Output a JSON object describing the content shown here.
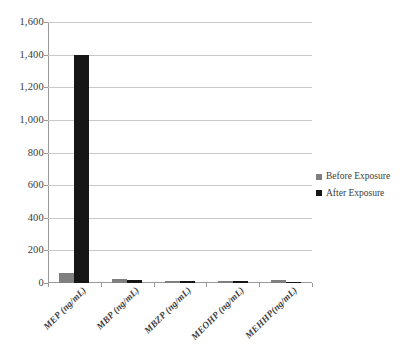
{
  "chart_data": {
    "type": "bar",
    "title": "",
    "xlabel": "",
    "ylabel": "",
    "ylim": [
      0,
      1600
    ],
    "ytick_step": 200,
    "grid": true,
    "legend_position": "right",
    "categories": [
      "MEP (ng/mL)",
      "MBP (ng/mL)",
      "MBZP (ng/mL)",
      "MEOHP (ng/mL)",
      "MEHHP(ng/mL)"
    ],
    "ytick_labels": [
      "0",
      "200",
      "400",
      "600",
      "800",
      "1,000",
      "1,200",
      "1,400",
      "1,600"
    ],
    "ytick_values": [
      0,
      200,
      400,
      600,
      800,
      1000,
      1200,
      1400,
      1600
    ],
    "series": [
      {
        "name": "Before Exposure",
        "color": "#7f7f7f",
        "values": [
          60,
          22,
          12,
          10,
          18
        ]
      },
      {
        "name": "After Exposure",
        "color": "#161616",
        "values": [
          1400,
          20,
          13,
          11,
          8
        ]
      }
    ]
  },
  "legend": {
    "items": [
      {
        "label": "Before Exposure",
        "swatch": "before"
      },
      {
        "label": "After Exposure",
        "swatch": "after"
      }
    ]
  }
}
